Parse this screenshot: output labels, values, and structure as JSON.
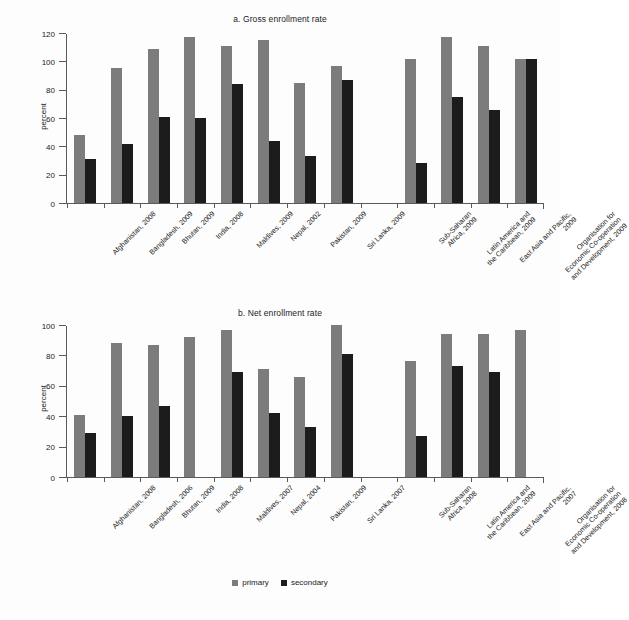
{
  "legend": {
    "primary_label": "primary",
    "secondary_label": "secondary",
    "primary_color": "#7c7c7c",
    "secondary_color": "#1c1c1c",
    "position": "bottom-center"
  },
  "chart_data": [
    {
      "type": "bar",
      "title": "a. Gross enrollment rate",
      "xlabel": "",
      "ylabel": "percent",
      "ylim": [
        0,
        120
      ],
      "yticks": [
        0,
        20,
        40,
        60,
        80,
        100,
        120
      ],
      "grid": false,
      "categories": [
        "Afghanistan, 2008",
        "Bangladesh, 2009",
        "Bhutan, 2009",
        "India, 2008",
        "Maldives, 2009",
        "Nepal, 2002",
        "Pakistan, 2009",
        "Sri Lanka, 2009",
        "",
        "Sub-Saharan\nAfrica, 2009",
        "Latin America and\nthe Caribbean, 2009",
        "East Asia and Pacific,\n2009",
        "Organisation for\nEconomic Co-operation\nand Development, 2009"
      ],
      "series": [
        {
          "name": "primary",
          "values": [
            48,
            95,
            109,
            117,
            111,
            115,
            85,
            97,
            null,
            102,
            117,
            111,
            102
          ]
        },
        {
          "name": "secondary",
          "values": [
            31,
            42,
            61,
            60,
            84,
            44,
            33,
            87,
            null,
            28,
            75,
            66,
            102
          ]
        }
      ]
    },
    {
      "type": "bar",
      "title": "b. Net enrollment rate",
      "xlabel": "",
      "ylabel": "percent",
      "ylim": [
        0,
        100
      ],
      "yticks": [
        0,
        20,
        40,
        60,
        80,
        100
      ],
      "grid": false,
      "categories": [
        "Afghanistan, 2008",
        "Bangladesh, 2006",
        "Bhutan, 2009",
        "India, 2008",
        "Maldives, 2007",
        "Nepal, 2004",
        "Pakistan, 2009",
        "Sri Lanka, 2007",
        "",
        "Sub-Saharan\nAfrica, 2008",
        "Latin America and\nthe Caribbean, 2009",
        "East Asia and Pacific,\n2007",
        "Organisation for\nEconomic Co-operation\nand Development, 2008"
      ],
      "series": [
        {
          "name": "primary",
          "values": [
            41,
            88,
            87,
            92,
            97,
            71,
            66,
            100,
            null,
            76,
            94,
            94,
            97
          ]
        },
        {
          "name": "secondary",
          "values": [
            29,
            40,
            47,
            null,
            69,
            42,
            33,
            81,
            null,
            27,
            73,
            69,
            null
          ]
        }
      ]
    }
  ]
}
